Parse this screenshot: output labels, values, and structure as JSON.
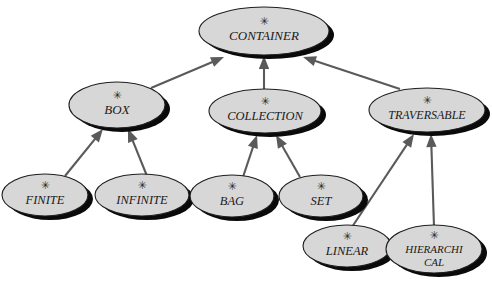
{
  "diagram": {
    "kind": "inheritance-hierarchy",
    "stereotype_glyph": "✳",
    "colors": {
      "node_fill": "#d7d7d7",
      "node_stroke": "#1e1e1e",
      "shadow": "#0a0a0a",
      "edge": "#5a5a5a",
      "background": "#ffffff",
      "label": "#1a1a1a"
    },
    "nodes": [
      {
        "id": "container",
        "label": "CONTAINER",
        "stereotype": "✳",
        "cx": 264,
        "cy": 31,
        "rx": 65,
        "ry": 24,
        "font_size": 13,
        "lines": [
          "CONTAINER"
        ]
      },
      {
        "id": "box",
        "label": "BOX",
        "stereotype": "✳",
        "cx": 117,
        "cy": 105,
        "rx": 48,
        "ry": 23,
        "font_size": 13,
        "lines": [
          "BOX"
        ]
      },
      {
        "id": "collection",
        "label": "COLLECTION",
        "stereotype": "✳",
        "cx": 265,
        "cy": 111,
        "rx": 56,
        "ry": 22,
        "font_size": 12.5,
        "lines": [
          "COLLECTION"
        ]
      },
      {
        "id": "traversable",
        "label": "TRAVERSABLE",
        "stereotype": "✳",
        "cx": 427,
        "cy": 110,
        "rx": 58,
        "ry": 22,
        "font_size": 12,
        "lines": [
          "TRAVERSABLE"
        ]
      },
      {
        "id": "finite",
        "label": "FINITE",
        "stereotype": "✳",
        "cx": 45,
        "cy": 195,
        "rx": 43,
        "ry": 21,
        "font_size": 12.5,
        "lines": [
          "FINITE"
        ]
      },
      {
        "id": "infinite",
        "label": "INFINITE",
        "stereotype": "✳",
        "cx": 142,
        "cy": 195,
        "rx": 47,
        "ry": 21,
        "font_size": 12.5,
        "lines": [
          "INFINITE"
        ]
      },
      {
        "id": "bag",
        "label": "BAG",
        "stereotype": "✳",
        "cx": 232,
        "cy": 196,
        "rx": 42,
        "ry": 21,
        "font_size": 12.5,
        "lines": [
          "BAG"
        ]
      },
      {
        "id": "set",
        "label": "SET",
        "stereotype": "✳",
        "cx": 321,
        "cy": 196,
        "rx": 42,
        "ry": 21,
        "font_size": 12.5,
        "lines": [
          "SET"
        ]
      },
      {
        "id": "linear",
        "label": "LINEAR",
        "stereotype": "✳",
        "cx": 347,
        "cy": 246,
        "rx": 44,
        "ry": 21,
        "font_size": 12.5,
        "lines": [
          "LINEAR"
        ]
      },
      {
        "id": "hierarchical",
        "label": "HIERARCHI/CAL",
        "stereotype": "✳",
        "cx": 434,
        "cy": 249,
        "rx": 48,
        "ry": 24,
        "font_size": 11,
        "lines": [
          "HIERARCHI",
          "CAL"
        ]
      }
    ],
    "edges": [
      {
        "id": "box-container",
        "from": "box",
        "to": "container",
        "x1": 151,
        "y1": 88,
        "x2": 224,
        "y2": 57
      },
      {
        "id": "collection-container",
        "from": "collection",
        "to": "container",
        "x1": 264,
        "y1": 89,
        "x2": 264,
        "y2": 56
      },
      {
        "id": "traversable-container",
        "from": "traversable",
        "to": "container",
        "x1": 400,
        "y1": 89,
        "x2": 303,
        "y2": 57
      },
      {
        "id": "finite-box",
        "from": "finite",
        "to": "box",
        "x1": 65,
        "y1": 176,
        "x2": 103,
        "y2": 129
      },
      {
        "id": "infinite-box",
        "from": "infinite",
        "to": "box",
        "x1": 147,
        "y1": 176,
        "x2": 128,
        "y2": 129
      },
      {
        "id": "bag-collection",
        "from": "bag",
        "to": "collection",
        "x1": 243,
        "y1": 177,
        "x2": 257,
        "y2": 135
      },
      {
        "id": "set-collection",
        "from": "set",
        "to": "collection",
        "x1": 300,
        "y1": 177,
        "x2": 276,
        "y2": 135
      },
      {
        "id": "linear-traversable",
        "from": "linear",
        "to": "traversable",
        "x1": 352,
        "y1": 227,
        "x2": 414,
        "y2": 134
      },
      {
        "id": "hierarchical-traversable",
        "from": "hierarchical",
        "to": "traversable",
        "x1": 434,
        "y1": 227,
        "x2": 431,
        "y2": 134
      }
    ]
  }
}
